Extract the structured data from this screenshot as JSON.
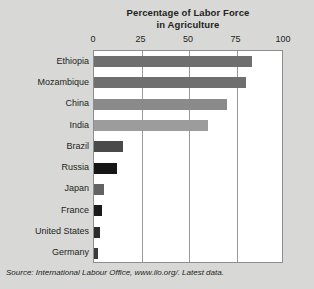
{
  "chart_data": {
    "type": "bar",
    "orientation": "horizontal",
    "title": "Percentage of Labor Force in Agriculture",
    "title_line1": "Percentage of Labor Force",
    "title_line2": "in Agriculture",
    "xlabel": "",
    "ylabel": "",
    "xlim": [
      0,
      100
    ],
    "xticks": [
      0,
      25,
      50,
      75,
      100
    ],
    "xtick_labels": [
      "0",
      "25",
      "50",
      "75",
      "100"
    ],
    "grid": "vertical-at-25-50-75",
    "legend": "none",
    "categories": [
      "Ethiopia",
      "Mozambique",
      "China",
      "India",
      "Brazil",
      "Russia",
      "Japan",
      "France",
      "United States",
      "Germany"
    ],
    "values": [
      83,
      80,
      70,
      60,
      15,
      12,
      5,
      4,
      3,
      2
    ],
    "bar_colors": [
      "#6f6f6f",
      "#6f6f6f",
      "#8a8a8a",
      "#9c9c9c",
      "#4a4a4a",
      "#151515",
      "#636363",
      "#1a1a1a",
      "#2b2b2b",
      "#3a3a3a"
    ],
    "source": "Source: International Labour Office, www.ilo.org/. Latest data."
  },
  "colors": {
    "background": "#d8d8d7",
    "plot_background": "#ffffff",
    "plot_border": "#8d8d8d",
    "gridline": "#9a9a9a",
    "text": "#231f20"
  }
}
